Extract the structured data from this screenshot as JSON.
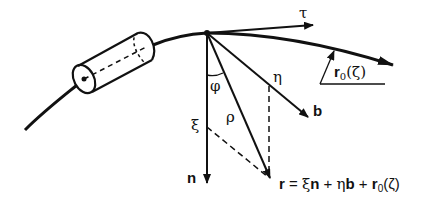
{
  "figure": {
    "labels": {
      "tau": "τ",
      "n": "n",
      "b": "b",
      "xi": "ξ",
      "eta": "η",
      "rho": "ρ",
      "phi": "φ",
      "r0": "r",
      "r0_sub": "0",
      "r0_arg": "(ζ)"
    },
    "formula": {
      "r": "r",
      "eq": " = ",
      "xi": "ξ",
      "n": "n",
      "plus1": " + ",
      "eta": "η",
      "b": "b",
      "plus2": " + ",
      "r0": "r",
      "r0_sub": "0",
      "r0_arg": "(ζ)"
    },
    "colors": {
      "ink": "#111111",
      "background": "#ffffff"
    }
  }
}
